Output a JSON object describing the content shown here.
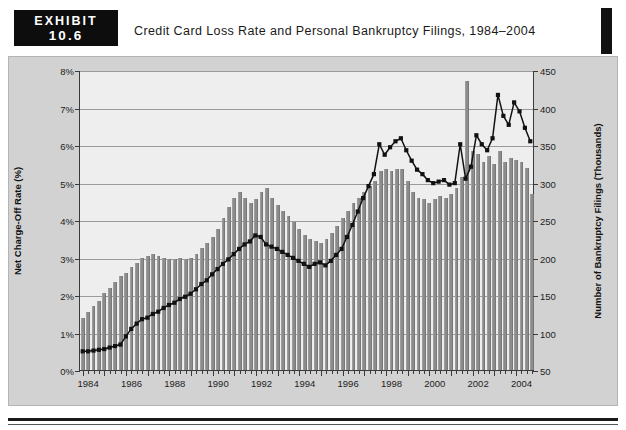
{
  "exhibit": {
    "word": "EXHIBIT",
    "number": "10.6",
    "title": "Credit Card Loss Rate and Personal Bankruptcy Filings, 1984–2004"
  },
  "chart_data": {
    "type": "bar",
    "title": "Credit Card Loss Rate and Personal Bankruptcy Filings, 1984–2004",
    "xlabel": "",
    "ylabel": "Net Charge-Off Rate (%)",
    "ylabel_right": "Number of Bankruptcy Filings (Thousands)",
    "ylim": [
      0,
      8
    ],
    "ylim_right": [
      50,
      450
    ],
    "grid": true,
    "legend_position": "top-center",
    "x_tick_labels": [
      "1984",
      "1986",
      "1988",
      "1990",
      "1992",
      "1994",
      "1996",
      "1998",
      "2000",
      "2002",
      "2004"
    ],
    "y_tick_labels_left": [
      "0%",
      "1%",
      "2%",
      "3%",
      "4%",
      "5%",
      "6%",
      "7%",
      "8%"
    ],
    "y_tick_labels_right": [
      "50",
      "100",
      "150",
      "200",
      "250",
      "300",
      "350",
      "400",
      "450"
    ],
    "x_period_note": "quarterly",
    "x": [
      "1984Q1",
      "1984Q2",
      "1984Q3",
      "1984Q4",
      "1985Q1",
      "1985Q2",
      "1985Q3",
      "1985Q4",
      "1986Q1",
      "1986Q2",
      "1986Q3",
      "1986Q4",
      "1987Q1",
      "1987Q2",
      "1987Q3",
      "1987Q4",
      "1988Q1",
      "1988Q2",
      "1988Q3",
      "1988Q4",
      "1989Q1",
      "1989Q2",
      "1989Q3",
      "1989Q4",
      "1990Q1",
      "1990Q2",
      "1990Q3",
      "1990Q4",
      "1991Q1",
      "1991Q2",
      "1991Q3",
      "1991Q4",
      "1992Q1",
      "1992Q2",
      "1992Q3",
      "1992Q4",
      "1993Q1",
      "1993Q2",
      "1993Q3",
      "1993Q4",
      "1994Q1",
      "1994Q2",
      "1994Q3",
      "1994Q4",
      "1995Q1",
      "1995Q2",
      "1995Q3",
      "1995Q4",
      "1996Q1",
      "1996Q2",
      "1996Q3",
      "1996Q4",
      "1997Q1",
      "1997Q2",
      "1997Q3",
      "1997Q4",
      "1998Q1",
      "1998Q2",
      "1998Q3",
      "1998Q4",
      "1999Q1",
      "1999Q2",
      "1999Q3",
      "1999Q4",
      "2000Q1",
      "2000Q2",
      "2000Q3",
      "2000Q4",
      "2001Q1",
      "2001Q2",
      "2001Q3",
      "2001Q4",
      "2002Q1",
      "2002Q2",
      "2002Q3",
      "2002Q4",
      "2003Q1",
      "2003Q2",
      "2003Q3",
      "2003Q4",
      "2004Q1",
      "2004Q2",
      "2004Q3",
      "2004Q4"
    ],
    "series": [
      {
        "name": "Net Credit Card Charge-Off Rates, %",
        "type": "bar",
        "axis": "left",
        "unit": "%",
        "color": "#8c8c8c",
        "values": [
          1.4,
          1.55,
          1.7,
          1.85,
          2.05,
          2.2,
          2.35,
          2.5,
          2.6,
          2.75,
          2.85,
          3.0,
          3.05,
          3.1,
          3.05,
          3.0,
          2.95,
          2.95,
          3.0,
          2.95,
          3.0,
          3.1,
          3.25,
          3.4,
          3.55,
          3.75,
          4.05,
          4.35,
          4.6,
          4.75,
          4.6,
          4.45,
          4.55,
          4.75,
          4.85,
          4.6,
          4.4,
          4.25,
          4.1,
          3.95,
          3.75,
          3.6,
          3.5,
          3.45,
          3.4,
          3.5,
          3.65,
          3.85,
          4.05,
          4.25,
          4.45,
          4.6,
          4.75,
          4.9,
          5.05,
          5.3,
          5.35,
          5.3,
          5.35,
          5.35,
          5.05,
          4.75,
          4.6,
          4.55,
          4.45,
          4.55,
          4.65,
          4.6,
          4.7,
          4.85,
          5.15,
          7.7,
          5.85,
          5.75,
          5.55,
          5.7,
          5.5,
          5.85,
          5.55,
          5.65,
          5.6,
          5.55,
          5.4,
          4.7
        ]
      },
      {
        "name": "Personal Bankruptcy Filings (Thousands)",
        "type": "line",
        "axis": "right",
        "unit": "thousands",
        "color": "#111111",
        "marker": "square",
        "values": [
          75,
          75,
          76,
          77,
          78,
          80,
          82,
          84,
          95,
          105,
          112,
          118,
          120,
          125,
          128,
          133,
          137,
          140,
          145,
          148,
          152,
          158,
          165,
          170,
          178,
          185,
          192,
          198,
          205,
          212,
          218,
          222,
          230,
          228,
          218,
          215,
          212,
          208,
          204,
          200,
          196,
          192,
          188,
          192,
          194,
          190,
          196,
          204,
          212,
          228,
          244,
          262,
          280,
          296,
          312,
          352,
          338,
          348,
          356,
          360,
          344,
          330,
          318,
          312,
          304,
          300,
          302,
          304,
          298,
          300,
          352,
          306,
          322,
          364,
          352,
          344,
          360,
          418,
          390,
          378,
          408,
          396,
          374,
          356
        ]
      }
    ]
  },
  "legend": [
    {
      "label": "Net Credit Card Charge-Off Rates, %",
      "key": "swatch"
    },
    {
      "label": "Personal Bankruptcy Filings (Thousands)",
      "key": "line-marker"
    }
  ],
  "colors": {
    "bar": "#8c8c8c",
    "line": "#111111",
    "plot_bg": "#eeeeee",
    "frame_bg": "#d2d2d2",
    "badge_bg": "#0d0d0d",
    "grid": "#9a9a9a"
  }
}
